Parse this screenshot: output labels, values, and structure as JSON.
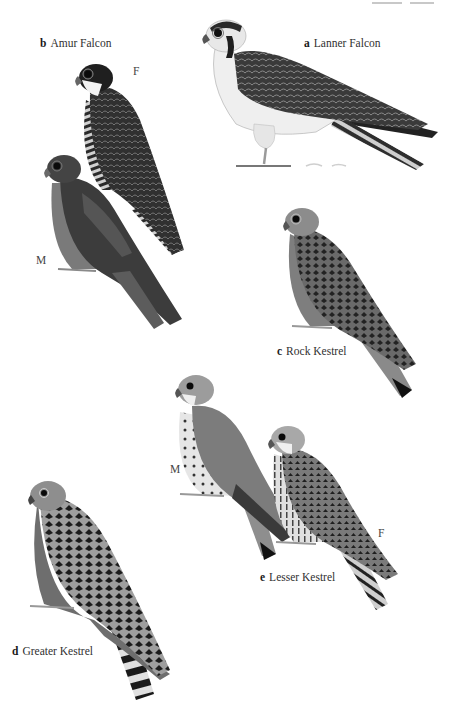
{
  "page": {
    "type": "field-guide-plate",
    "background": "#ffffff"
  },
  "species": [
    {
      "letter": "a",
      "name": "Lanner Falcon"
    },
    {
      "letter": "b",
      "name": "Amur Falcon",
      "sex_labels": [
        "F",
        "M"
      ]
    },
    {
      "letter": "c",
      "name": "Rock Kestrel"
    },
    {
      "letter": "d",
      "name": "Greater Kestrel"
    },
    {
      "letter": "e",
      "name": "Lesser Kestrel",
      "sex_labels": [
        "M",
        "F"
      ]
    }
  ],
  "colors": {
    "text": "#303030",
    "dark_plumage": "#2b2b2b",
    "mid_plumage": "#6e6e6e",
    "light_plumage": "#d6d6d6",
    "grey_hood": "#9a9a9a"
  }
}
